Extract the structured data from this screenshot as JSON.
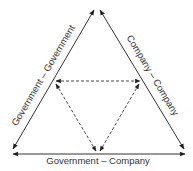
{
  "diagram": {
    "type": "triangle-relationship",
    "edges": {
      "left": {
        "label": "Government – Government"
      },
      "right": {
        "label": "Company – Company"
      },
      "bottom": {
        "label": "Government – Company"
      }
    },
    "colors": {
      "line": "#333333",
      "background": "#ffffff"
    },
    "inner_triangle": {
      "style": "dashed",
      "arrows": "bidirectional"
    }
  }
}
